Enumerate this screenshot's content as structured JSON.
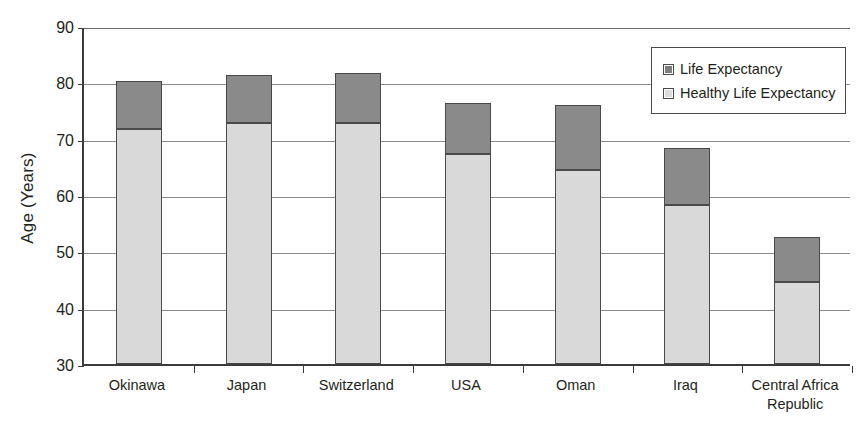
{
  "chart_data": {
    "type": "bar",
    "subtype": "stacked-bar",
    "title": "",
    "xlabel": "",
    "ylabel": "Age (Years)",
    "ylim": [
      30,
      90
    ],
    "ytick_step": 10,
    "yticks": [
      30,
      40,
      50,
      60,
      70,
      80,
      90
    ],
    "ytick_labels": [
      "30",
      "40",
      "50",
      "60",
      "70",
      "80",
      "90"
    ],
    "grid": true,
    "legend_position": "top-right",
    "categories": [
      "Okinawa",
      "Japan",
      "Switzerland",
      "USA",
      "Oman",
      "Iraq",
      "Central Africa Republic"
    ],
    "category_lines": [
      [
        "Okinawa"
      ],
      [
        "Japan"
      ],
      [
        "Switzerland"
      ],
      [
        "USA"
      ],
      [
        "Oman"
      ],
      [
        "Iraq"
      ],
      [
        "Central Africa",
        "Republic"
      ]
    ],
    "series": [
      {
        "name": "Healthy Life Expectancy",
        "color": "#d9d9d9",
        "stack_order": 0,
        "values": [
          71.8,
          72.8,
          72.7,
          67.2,
          64.5,
          58.2,
          44.6
        ]
      },
      {
        "name": "Life Expectancy",
        "color": "#8a8a8a",
        "stack_order": 1,
        "note": "Segment drawn from healthy life expectancy up to total life expectancy",
        "totals": [
          80.2,
          81.3,
          81.6,
          76.4,
          75.9,
          68.4,
          52.5
        ]
      }
    ]
  },
  "legend": {
    "items": [
      {
        "label": "Life Expectancy",
        "swatch": "dark"
      },
      {
        "label": "Healthy Life Expectancy",
        "swatch": "light"
      }
    ]
  },
  "axis": {
    "y_title": "Age (Years)"
  },
  "colors": {
    "life_expectancy": "#8a8a8a",
    "healthy_life_expectancy": "#d9d9d9",
    "axis": "#3b3b3b",
    "gridline": "#8c8c8c",
    "text": "#231f20",
    "background": "#ffffff"
  }
}
